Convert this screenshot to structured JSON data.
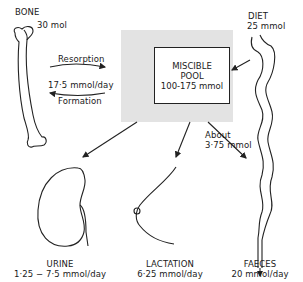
{
  "diagram": {
    "pool": {
      "line1": "MISCIBLE",
      "line2": "POOL",
      "amount": "100-175 mmol"
    },
    "bone": {
      "label": "BONE",
      "amount": "30 mol"
    },
    "diet": {
      "label": "DIET",
      "amount": "25 mmol"
    },
    "exchange": {
      "resorption": "Resorption",
      "rate": "17·5 mmol/day",
      "formation": "Formation"
    },
    "gut_secretion": {
      "line1": "About",
      "line2": "3·75 mmol"
    },
    "outputs": [
      {
        "label": "URINE",
        "rate": "1·25 − 7·5 mmol/day"
      },
      {
        "label": "LACTATION",
        "rate": "6·25 mmol/day"
      },
      {
        "label": "FAECES",
        "rate": "20 mmol/day"
      }
    ]
  }
}
